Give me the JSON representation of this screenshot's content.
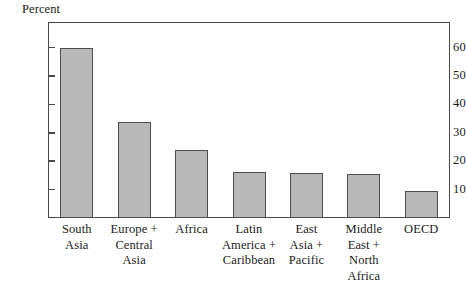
{
  "chart_data": {
    "type": "bar",
    "title": "",
    "subtitle": "",
    "xlabel": "",
    "ylabel": "Percent",
    "ylim": [
      0,
      69
    ],
    "yticks": [
      10,
      20,
      30,
      40,
      50,
      60
    ],
    "ytick_labels": [
      "10",
      "20",
      "30",
      "40",
      "50",
      "60"
    ],
    "grid": false,
    "legend": false,
    "legend_position": "none",
    "categories": [
      "South Asia",
      "Europe + Central Asia",
      "Africa",
      "Latin America + Caribbean",
      "East Asia + Pacific",
      "Middle East + North Africa",
      "OECD"
    ],
    "category_lines": [
      [
        "South",
        "Asia"
      ],
      [
        "Europe +",
        "Central",
        "Asia"
      ],
      [
        "Africa"
      ],
      [
        "Latin",
        "America +",
        "Caribbean"
      ],
      [
        "East",
        "Asia +",
        "Pacific"
      ],
      [
        "Middle",
        "East +",
        "North",
        "Africa"
      ],
      [
        "OECD"
      ]
    ],
    "values": [
      60.0,
      33.7,
      23.9,
      16.3,
      16.0,
      15.5,
      9.4
    ],
    "colors": {
      "bar_fill": "#b9b9b9",
      "bar_stroke": "#4d4d4d",
      "axis": "#4a4a4a",
      "text": "#1a1a1a",
      "background": "#ffffff"
    }
  },
  "axis": {
    "unit_label": "Percent"
  }
}
